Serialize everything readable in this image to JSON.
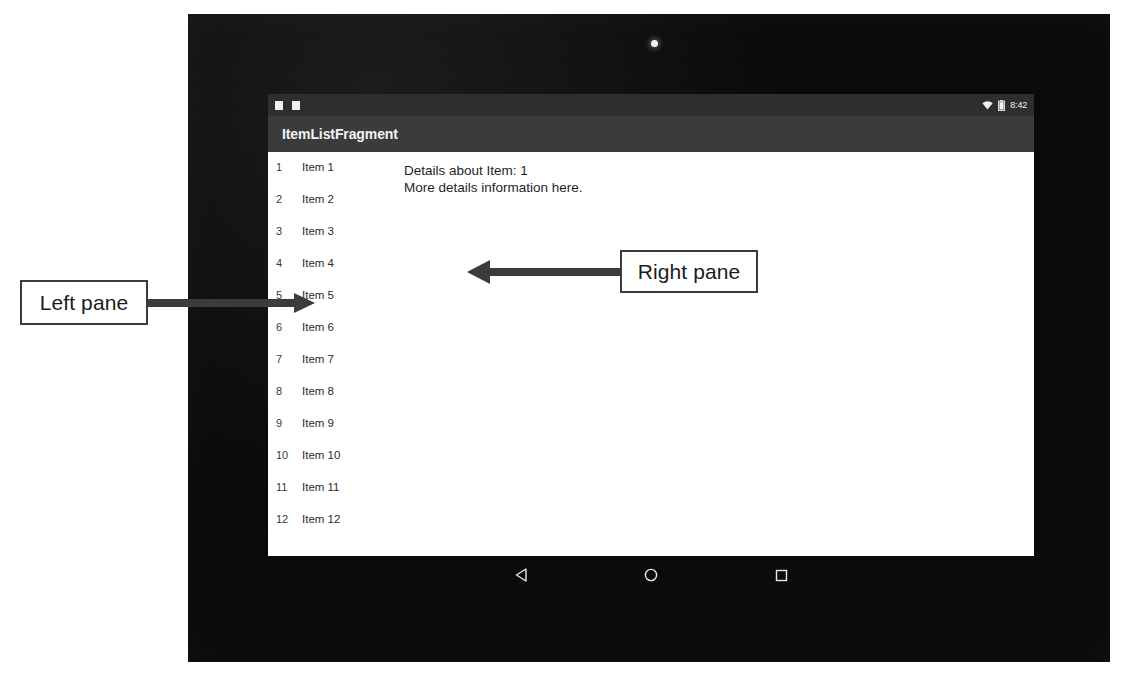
{
  "annotations": [
    {
      "id": "left",
      "label": "Left pane",
      "arrow": "right"
    },
    {
      "id": "right",
      "label": "Right pane",
      "arrow": "left"
    }
  ],
  "device": {
    "type": "android-tablet",
    "camera": "camera-dot"
  },
  "status_bar": {
    "time": "8:42",
    "notification_icons": [
      "notification-icon",
      "notification-icon"
    ],
    "wifi_icon": "wifi-icon",
    "battery_icon": "battery-icon"
  },
  "app_bar": {
    "title": "ItemListFragment"
  },
  "left_pane": {
    "name": "item-list",
    "selected_index": 5,
    "items": [
      {
        "index": "1",
        "label": "Item 1"
      },
      {
        "index": "2",
        "label": "Item 2"
      },
      {
        "index": "3",
        "label": "Item 3"
      },
      {
        "index": "4",
        "label": "Item 4"
      },
      {
        "index": "5",
        "label": "Item 5"
      },
      {
        "index": "6",
        "label": "Item 6"
      },
      {
        "index": "7",
        "label": "Item 7"
      },
      {
        "index": "8",
        "label": "Item 8"
      },
      {
        "index": "9",
        "label": "Item 9"
      },
      {
        "index": "10",
        "label": "Item 10"
      },
      {
        "index": "11",
        "label": "Item 11"
      },
      {
        "index": "12",
        "label": "Item 12"
      }
    ]
  },
  "right_pane": {
    "name": "item-detail",
    "line1": "Details about Item: 1",
    "line2": "More details information here."
  },
  "nav_bar": {
    "back": "back-triangle-icon",
    "home": "home-circle-icon",
    "recents": "recents-square-icon"
  },
  "colors": {
    "app_bar": "#3b3b3b",
    "status_bar": "#2e2e2e",
    "screen": "#ffffff",
    "bezel": "#0a0a0a",
    "annotation_stroke": "#3b3b3b"
  }
}
